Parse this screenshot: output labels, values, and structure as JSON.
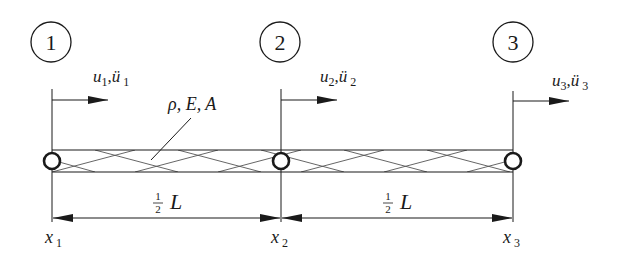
{
  "diagram": {
    "colors": {
      "stroke": "#1a1a1a",
      "background": "#ffffff",
      "hatch": "#555555"
    },
    "nodes": [
      {
        "id": "1",
        "label": "1",
        "x_label": "x",
        "x_sub": "1",
        "disp": "u",
        "acc": "ü",
        "sub": "1"
      },
      {
        "id": "2",
        "label": "2",
        "x_label": "x",
        "x_sub": "2",
        "disp": "u",
        "acc": "ü",
        "sub": "2"
      },
      {
        "id": "3",
        "label": "3",
        "x_label": "x",
        "x_sub": "3",
        "disp": "u",
        "acc": "ü",
        "sub": "3"
      }
    ],
    "bar_properties": "ρ, E, A",
    "dimensions": [
      {
        "num": "1",
        "den": "2",
        "symbol": "L"
      },
      {
        "num": "1",
        "den": "2",
        "symbol": "L"
      }
    ],
    "comma": ","
  }
}
